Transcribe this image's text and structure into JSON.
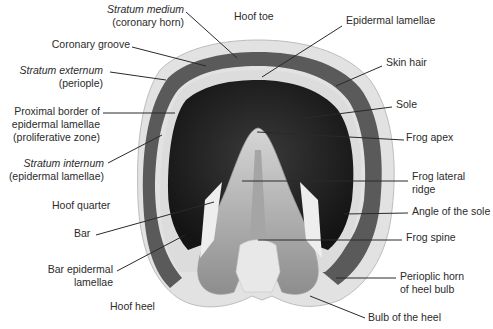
{
  "figure": {
    "labels": {
      "stratum_medium": {
        "line1": "Stratum medium",
        "line2": "(coronary horn)"
      },
      "hoof_toe": "Hoof toe",
      "epidermal_lamellae": "Epidermal lamellae",
      "coronary_groove": "Coronary groove",
      "stratum_externum": {
        "line1": "Stratum externum",
        "line2": "(periople)"
      },
      "skin_hair": "Skin hair",
      "proximal_border": {
        "line1": "Proximal border of",
        "line2": "epidermal lamellae",
        "line3": "(proliferative zone)"
      },
      "sole": "Sole",
      "frog_apex": "Frog apex",
      "stratum_internum": {
        "line1": "Stratum internum",
        "line2": "(epidermal lamellae)"
      },
      "frog_lateral_ridge": {
        "line1": "Frog lateral",
        "line2": "ridge"
      },
      "hoof_quarter": "Hoof quarter",
      "angle_of_sole": "Angle of the sole",
      "bar": "Bar",
      "frog_spine": "Frog spine",
      "bar_epidermal_lamellae": {
        "line1": "Bar epidermal",
        "line2": "lamellae"
      },
      "perioplic_horn": {
        "line1": "Perioplic horn",
        "line2": "of heel bulb"
      },
      "hoof_heel": "Hoof heel",
      "bulb_of_heel": "Bulb of the heel"
    }
  }
}
